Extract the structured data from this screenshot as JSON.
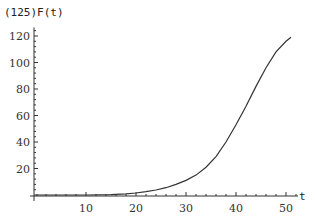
{
  "chart_data": {
    "type": "line",
    "title": "",
    "xlabel": "t",
    "ylabel": "(125)F(t)",
    "xlim": [
      0,
      52
    ],
    "ylim": [
      0,
      125
    ],
    "x_ticks": [
      10,
      20,
      30,
      40,
      50
    ],
    "y_ticks": [
      20,
      40,
      60,
      80,
      100,
      120
    ],
    "grid": false,
    "legend": null,
    "series": [
      {
        "name": "(125)F(t)",
        "color": "#333333",
        "x": [
          0,
          5,
          10,
          15,
          18,
          20,
          22,
          24,
          26,
          28,
          30,
          32,
          34,
          36,
          38,
          40,
          42,
          44,
          46,
          48,
          50,
          51
        ],
        "values": [
          0,
          0,
          0,
          0.3,
          0.8,
          1.5,
          2.5,
          3.8,
          5.5,
          8,
          11,
          15,
          21,
          29,
          40,
          53,
          67,
          82,
          96,
          108,
          116,
          119
        ]
      }
    ]
  }
}
